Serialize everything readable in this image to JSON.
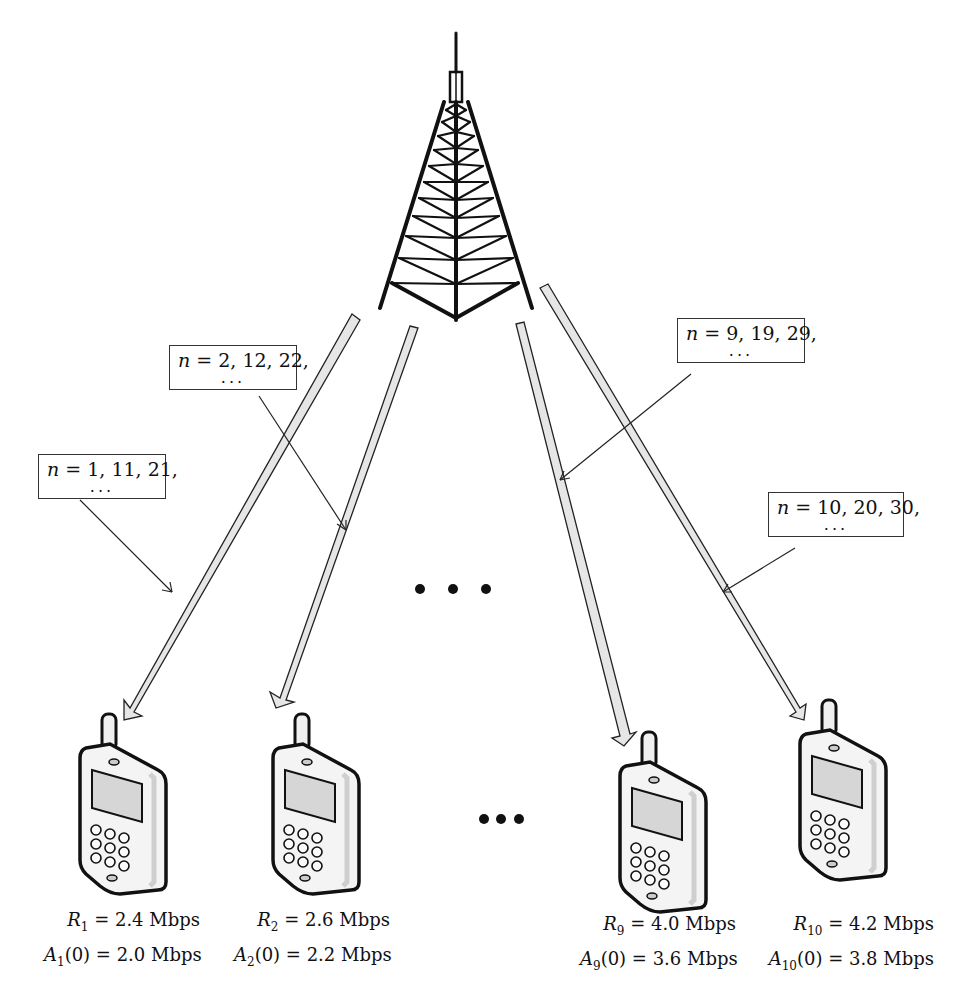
{
  "figure": {
    "type": "base-station-to-mobile-users diagram",
    "tower_icon": "cell-tower-icon",
    "phone_icon": "mobile-phone-icon",
    "ellipsis_middle": "• • •",
    "ellipsis_bottom": "•••"
  },
  "slot_labels": [
    {
      "var": "n",
      "text": " = 1, 11, 21,",
      "dots": "..."
    },
    {
      "var": "n",
      "text": " = 2, 12, 22,",
      "dots": "..."
    },
    {
      "var": "n",
      "text": " = 9, 19, 29,",
      "dots": "..."
    },
    {
      "var": "n",
      "text": " = 10, 20, 30,",
      "dots": "..."
    }
  ],
  "users": [
    {
      "r_var": "R",
      "r_sub": "1",
      "r_val": " = 2.4 Mbps",
      "a_var": "A",
      "a_sub": "1",
      "a_val": "(0) = 2.0 Mbps"
    },
    {
      "r_var": "R",
      "r_sub": "2",
      "r_val": " = 2.6 Mbps",
      "a_var": "A",
      "a_sub": "2",
      "a_val": "(0) = 2.2 Mbps"
    },
    {
      "r_var": "R",
      "r_sub": "9",
      "r_val": " = 4.0 Mbps",
      "a_var": "A",
      "a_sub": "9",
      "a_val": "(0) = 3.6 Mbps"
    },
    {
      "r_var": "R",
      "r_sub": "10",
      "r_val": " = 4.2 Mbps",
      "a_var": "A",
      "a_sub": "10",
      "a_val": "(0) = 3.8 Mbps"
    }
  ],
  "colors": {
    "line": "#1a1a1a",
    "beam_fill": "#e6e6e6",
    "phone_fill": "#f2f2f2",
    "screen_fill": "#d9d9d9"
  }
}
